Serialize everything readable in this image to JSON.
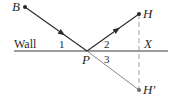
{
  "diagram": {
    "title": "",
    "points": {
      "B": {
        "label": "B",
        "x": 25,
        "y": 7
      },
      "H": {
        "label": "H",
        "x": 139,
        "y": 14
      },
      "P": {
        "label": "P",
        "x": 87,
        "y": 51
      },
      "H_prime": {
        "label": "H′",
        "x": 139,
        "y": 90
      },
      "X": {
        "label": "X",
        "x": 139,
        "y": 51
      }
    },
    "wall": {
      "label": "Wall",
      "x1": 14,
      "x2": 168,
      "y": 51
    },
    "angles": {
      "angle1": "1",
      "angle2": "2",
      "angle3": "3"
    },
    "colors": {
      "ink": "#2a2a2a",
      "light_line": "#7a7a7a"
    }
  }
}
